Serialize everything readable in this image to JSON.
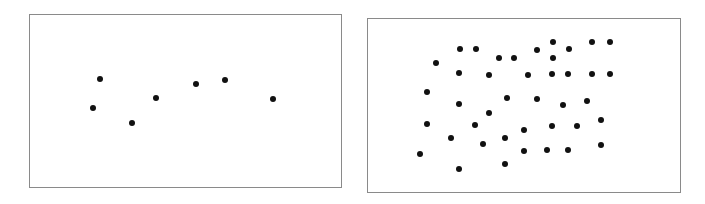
{
  "chart_data": [
    {
      "type": "scatter",
      "title": "",
      "xlabel": "",
      "ylabel": "",
      "grid": false,
      "legend": null,
      "panel_box_px": {
        "left": 29,
        "top": 14,
        "right": 342,
        "bottom": 188
      },
      "points_px": [
        [
          100,
          79
        ],
        [
          93,
          108
        ],
        [
          132,
          123
        ],
        [
          156,
          98
        ],
        [
          196,
          84
        ],
        [
          225,
          80
        ],
        [
          273,
          99
        ]
      ]
    },
    {
      "type": "scatter",
      "title": "",
      "xlabel": "",
      "ylabel": "",
      "grid": false,
      "legend": null,
      "panel_box_px": {
        "left": 367,
        "top": 18,
        "right": 681,
        "bottom": 193
      },
      "points_px": [
        [
          460,
          49
        ],
        [
          476,
          49
        ],
        [
          436,
          63
        ],
        [
          499,
          58
        ],
        [
          514,
          58
        ],
        [
          537,
          50
        ],
        [
          553,
          42
        ],
        [
          553,
          58
        ],
        [
          569,
          49
        ],
        [
          592,
          42
        ],
        [
          610,
          42
        ],
        [
          459,
          73
        ],
        [
          489,
          75
        ],
        [
          528,
          75
        ],
        [
          552,
          74
        ],
        [
          568,
          74
        ],
        [
          592,
          74
        ],
        [
          610,
          74
        ],
        [
          427,
          92
        ],
        [
          459,
          104
        ],
        [
          507,
          98
        ],
        [
          537,
          99
        ],
        [
          563,
          105
        ],
        [
          587,
          101
        ],
        [
          489,
          113
        ],
        [
          427,
          124
        ],
        [
          475,
          125
        ],
        [
          524,
          130
        ],
        [
          552,
          126
        ],
        [
          577,
          126
        ],
        [
          601,
          120
        ],
        [
          451,
          138
        ],
        [
          483,
          144
        ],
        [
          505,
          138
        ],
        [
          524,
          151
        ],
        [
          547,
          150
        ],
        [
          568,
          150
        ],
        [
          601,
          145
        ],
        [
          420,
          154
        ],
        [
          505,
          164
        ],
        [
          459,
          169
        ]
      ]
    }
  ],
  "style": {
    "dot_color": "#111111",
    "frame_color": "#8a8a8a",
    "background": "#ffffff"
  }
}
